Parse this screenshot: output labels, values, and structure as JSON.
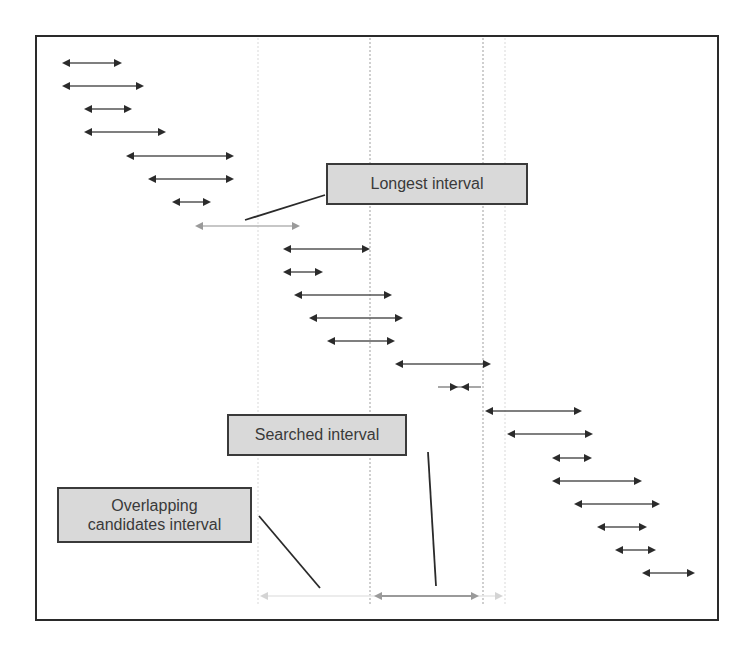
{
  "diagram": {
    "type": "interval-overlap-illustration",
    "colors": {
      "arrow": "#2b2b2b",
      "arrow_highlight": "#9a9a9a",
      "arrow_faint": "#d4d4d4",
      "label_fill": "#d9d9d9",
      "label_border": "#3a3a3a",
      "guide_line": "#b0b0b0",
      "guide_line_faint": "#e0e0e0",
      "frame": "#2a2a2a"
    },
    "labels": {
      "longest": "Longest interval",
      "searched": "Searched interval",
      "overlapping_line1": "Overlapping",
      "overlapping_line2": "candidates interval"
    },
    "guides": [
      {
        "x": 258,
        "style": "faint"
      },
      {
        "x": 370,
        "style": "dotted"
      },
      {
        "x": 483,
        "style": "dotted"
      },
      {
        "x": 505,
        "style": "faint"
      }
    ],
    "intervals": [
      {
        "y": 63,
        "x1": 60,
        "x2": 124,
        "kind": "normal"
      },
      {
        "y": 86,
        "x1": 60,
        "x2": 146,
        "kind": "normal"
      },
      {
        "y": 109,
        "x1": 82,
        "x2": 134,
        "kind": "normal"
      },
      {
        "y": 132,
        "x1": 82,
        "x2": 168,
        "kind": "normal"
      },
      {
        "y": 156,
        "x1": 124,
        "x2": 236,
        "kind": "normal"
      },
      {
        "y": 179,
        "x1": 146,
        "x2": 236,
        "kind": "normal"
      },
      {
        "y": 202,
        "x1": 170,
        "x2": 213,
        "kind": "normal"
      },
      {
        "y": 226,
        "x1": 193,
        "x2": 302,
        "kind": "longest"
      },
      {
        "y": 249,
        "x1": 281,
        "x2": 372,
        "kind": "normal"
      },
      {
        "y": 272,
        "x1": 281,
        "x2": 325,
        "kind": "normal"
      },
      {
        "y": 295,
        "x1": 292,
        "x2": 394,
        "kind": "normal"
      },
      {
        "y": 318,
        "x1": 307,
        "x2": 405,
        "kind": "normal"
      },
      {
        "y": 341,
        "x1": 325,
        "x2": 397,
        "kind": "normal"
      },
      {
        "y": 364,
        "x1": 393,
        "x2": 493,
        "kind": "normal"
      },
      {
        "y": 387,
        "x1": 452,
        "x2": 467,
        "kind": "tiny"
      },
      {
        "y": 411,
        "x1": 483,
        "x2": 584,
        "kind": "normal"
      },
      {
        "y": 434,
        "x1": 505,
        "x2": 595,
        "kind": "normal"
      },
      {
        "y": 458,
        "x1": 550,
        "x2": 594,
        "kind": "normal"
      },
      {
        "y": 481,
        "x1": 550,
        "x2": 644,
        "kind": "normal"
      },
      {
        "y": 504,
        "x1": 572,
        "x2": 662,
        "kind": "normal"
      },
      {
        "y": 527,
        "x1": 595,
        "x2": 649,
        "kind": "normal"
      },
      {
        "y": 550,
        "x1": 613,
        "x2": 658,
        "kind": "normal"
      },
      {
        "y": 573,
        "x1": 640,
        "x2": 697,
        "kind": "normal"
      }
    ],
    "candidates_interval": {
      "y": 596,
      "x1": 258,
      "x2": 505
    },
    "searched_interval": {
      "y": 596,
      "x1": 370,
      "x2": 483
    },
    "callouts": [
      {
        "from": [
          325,
          195
        ],
        "to": [
          245,
          220
        ],
        "target": "longest"
      },
      {
        "from": [
          428,
          452
        ],
        "to": [
          436,
          586
        ],
        "target": "searched"
      },
      {
        "from": [
          259,
          516
        ],
        "to": [
          320,
          588
        ],
        "target": "overlapping"
      }
    ]
  }
}
